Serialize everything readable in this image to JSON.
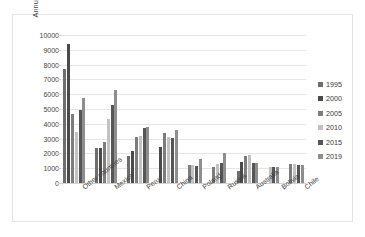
{
  "chart_data": {
    "type": "bar",
    "title": "",
    "xlabel": "",
    "ylabel": "Annual silver production\n(metric tons)",
    "ylabel_line1": "Annual silver production",
    "ylabel_line2": "(metric tons)",
    "ylim": [
      0,
      10000
    ],
    "ytick_step": 1000,
    "yticks": [
      "0",
      "1000",
      "2000",
      "3000",
      "4000",
      "5000",
      "6000",
      "7000",
      "8000",
      "9000",
      "10000"
    ],
    "grid": true,
    "legend_position": "right",
    "categories": [
      "Other countries",
      "Mexico",
      "Peru",
      "China",
      "Poland",
      "Russia",
      "Australia",
      "Bolivia",
      "Chile"
    ],
    "series": [
      {
        "name": "1995",
        "color": "#6e6e6e",
        "values": [
          7700,
          2350,
          1850,
          null,
          null,
          null,
          800,
          null,
          null
        ]
      },
      {
        "name": "2000",
        "color": "#4a4a4a",
        "values": [
          9400,
          2350,
          2150,
          2450,
          null,
          null,
          1400,
          null,
          null
        ]
      },
      {
        "name": "2005",
        "color": "#7d7d7d",
        "values": [
          4650,
          2800,
          3100,
          3350,
          1200,
          1050,
          1800,
          null,
          1300
        ]
      },
      {
        "name": "2010",
        "color": "#c2c2c2",
        "values": [
          3450,
          4300,
          3150,
          3100,
          1200,
          1300,
          1900,
          1100,
          1300
        ]
      },
      {
        "name": "2015",
        "color": "#565656",
        "values": [
          4950,
          5300,
          3700,
          3050,
          1150,
          1350,
          1350,
          1100,
          1250
        ]
      },
      {
        "name": "2019",
        "color": "#8e8e8e",
        "values": [
          5750,
          6300,
          3800,
          3550,
          1600,
          2000,
          1350,
          1100,
          1250
        ]
      }
    ]
  },
  "legend": {
    "items": [
      {
        "label": "1995"
      },
      {
        "label": "2000"
      },
      {
        "label": "2005"
      },
      {
        "label": "2010"
      },
      {
        "label": "2015"
      },
      {
        "label": "2019"
      }
    ]
  }
}
